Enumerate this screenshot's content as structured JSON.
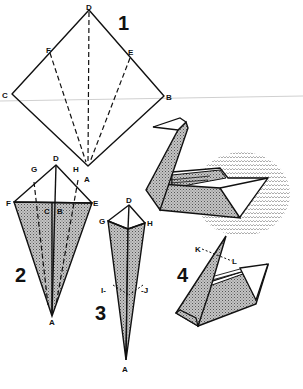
{
  "diagram": {
    "steps": [
      {
        "number": "1",
        "labels": {
          "D": "D",
          "F": "F",
          "E": "E",
          "C": "C",
          "B": "B",
          "A": "A"
        }
      },
      {
        "number": "2",
        "labels": {
          "D": "D",
          "G": "G",
          "H": "H",
          "F": "F",
          "C": "C",
          "B": "B",
          "E": "E",
          "A": "A"
        }
      },
      {
        "number": "3",
        "labels": {
          "D": "D",
          "G": "G",
          "H": "H",
          "I": "I-",
          "J": "-J",
          "A": "A"
        }
      },
      {
        "number": "4",
        "labels": {
          "K": "K",
          "L": "L"
        }
      }
    ],
    "colors": {
      "line": "#111111",
      "shade": "#9a9a9a",
      "background": "#ffffff",
      "scan_line": "#d0d0d0"
    }
  }
}
